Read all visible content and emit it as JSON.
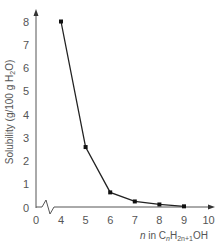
{
  "chart_data": {
    "type": "line",
    "title": "",
    "xlabel": "n in CnH2n+1OH",
    "xlabel_parts": {
      "prefix": "n",
      "mid": " in C",
      "sub1": "n",
      "mid2": "H",
      "sub2": "2n+1",
      "suffix": "OH"
    },
    "ylabel": "Solubility (g/100 g H2O)",
    "ylabel_parts": {
      "main": "Solubility (g/100 g H",
      "sub": "2",
      "suffix": "O)"
    },
    "x": [
      4,
      5,
      6,
      7,
      8,
      9
    ],
    "values": [
      8.0,
      2.6,
      0.65,
      0.26,
      0.13,
      0.05
    ],
    "x_ticks": [
      "0",
      "4",
      "5",
      "6",
      "7",
      "8",
      "9",
      "10"
    ],
    "y_ticks": [
      "0",
      "1",
      "2",
      "3",
      "4",
      "5",
      "6",
      "7",
      "8"
    ],
    "xlim": [
      4,
      10
    ],
    "ylim": [
      0,
      8
    ],
    "x_axis_break": true,
    "grid": false,
    "legend": null,
    "line_color": "#222222",
    "axis_color": "#555555"
  }
}
